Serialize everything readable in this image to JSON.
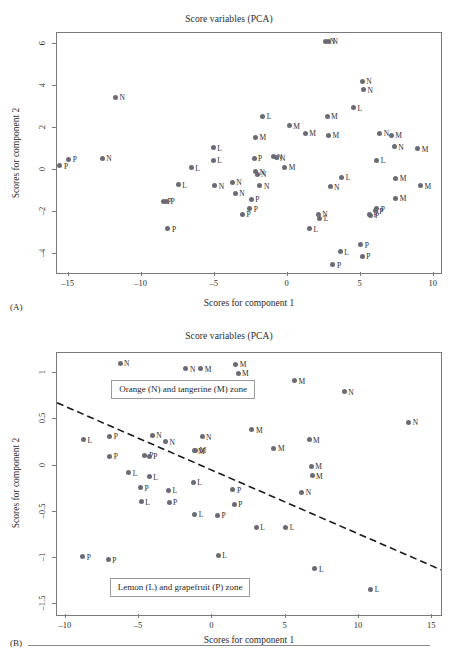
{
  "figure": {
    "panel_a_label": "(A)",
    "panel_b_label": "(B)"
  },
  "chart_data": [
    {
      "panel": "(A)",
      "type": "scatter",
      "title": "Score variables (PCA)",
      "xlabel": "Scores for component 1",
      "ylabel": "Scores for component 2",
      "xlim": [
        -15.8,
        10.5
      ],
      "ylim": [
        -4.9,
        6.5
      ],
      "xticks": [
        -15,
        -10,
        -5,
        0,
        5,
        10
      ],
      "xticklabels": [
        "–15",
        "–10",
        "–5",
        "0",
        "5",
        "10"
      ],
      "yticks": [
        -4,
        -2,
        0,
        2,
        4,
        6
      ],
      "yticklabels": [
        "–4",
        "–2",
        "0",
        "2",
        "4",
        "6"
      ],
      "grid": false,
      "legend": "none",
      "point_color": "#6b6b76",
      "groups": [
        "N",
        "M",
        "L",
        "P"
      ],
      "points": [
        {
          "x": -15.6,
          "y": 0.2,
          "label": "P"
        },
        {
          "x": -15.0,
          "y": 0.5,
          "label": "P"
        },
        {
          "x": -12.7,
          "y": 0.55,
          "label": "N"
        },
        {
          "x": -11.8,
          "y": 3.45,
          "label": "N"
        },
        {
          "x": -8.5,
          "y": -1.5,
          "label": "P"
        },
        {
          "x": -8.3,
          "y": -1.5,
          "label": "P"
        },
        {
          "x": -8.2,
          "y": -2.8,
          "label": "P"
        },
        {
          "x": -7.5,
          "y": -0.7,
          "label": "L"
        },
        {
          "x": -6.6,
          "y": 0.1,
          "label": "L"
        },
        {
          "x": -5.1,
          "y": 1.05,
          "label": "L"
        },
        {
          "x": -5.1,
          "y": 0.45,
          "label": "L"
        },
        {
          "x": -5.0,
          "y": -0.75,
          "label": "N"
        },
        {
          "x": -3.8,
          "y": -0.6,
          "label": "N"
        },
        {
          "x": -3.6,
          "y": -1.1,
          "label": "N"
        },
        {
          "x": -3.1,
          "y": -2.1,
          "label": "P"
        },
        {
          "x": -2.6,
          "y": -1.85,
          "label": "P"
        },
        {
          "x": -2.5,
          "y": -1.4,
          "label": "P"
        },
        {
          "x": -2.3,
          "y": 0.55,
          "label": "P"
        },
        {
          "x": -2.2,
          "y": 1.55,
          "label": "M"
        },
        {
          "x": -2.2,
          "y": -0.1,
          "label": "N"
        },
        {
          "x": -2.1,
          "y": -0.2,
          "label": "N"
        },
        {
          "x": -1.9,
          "y": -0.75,
          "label": "N"
        },
        {
          "x": -1.7,
          "y": 2.55,
          "label": "L"
        },
        {
          "x": -1.0,
          "y": 0.62,
          "label": "N"
        },
        {
          "x": -0.8,
          "y": 0.58,
          "label": "N"
        },
        {
          "x": -0.2,
          "y": 0.12,
          "label": "M"
        },
        {
          "x": 0.1,
          "y": 2.1,
          "label": "M"
        },
        {
          "x": 1.2,
          "y": 1.75,
          "label": "M"
        },
        {
          "x": 1.5,
          "y": -2.8,
          "label": "L"
        },
        {
          "x": 2.1,
          "y": -2.1,
          "label": "N"
        },
        {
          "x": 2.2,
          "y": -2.3,
          "label": "L"
        },
        {
          "x": 2.6,
          "y": 6.1,
          "label": "N"
        },
        {
          "x": 2.8,
          "y": 6.1,
          "label": "N"
        },
        {
          "x": 2.7,
          "y": 2.55,
          "label": "M"
        },
        {
          "x": 2.8,
          "y": 1.65,
          "label": "M"
        },
        {
          "x": 2.9,
          "y": -0.8,
          "label": "N"
        },
        {
          "x": 3.1,
          "y": -4.5,
          "label": "P"
        },
        {
          "x": 3.6,
          "y": -3.9,
          "label": "L"
        },
        {
          "x": 3.7,
          "y": -0.35,
          "label": "L"
        },
        {
          "x": 4.5,
          "y": 2.95,
          "label": "L"
        },
        {
          "x": 5.0,
          "y": -3.55,
          "label": "P"
        },
        {
          "x": 5.1,
          "y": 4.2,
          "label": "N"
        },
        {
          "x": 5.1,
          "y": -4.1,
          "label": "P"
        },
        {
          "x": 5.2,
          "y": 3.8,
          "label": "N"
        },
        {
          "x": 5.6,
          "y": -2.1,
          "label": "P"
        },
        {
          "x": 5.7,
          "y": -2.15,
          "label": "P"
        },
        {
          "x": 6.0,
          "y": -1.95,
          "label": "P"
        },
        {
          "x": 6.1,
          "y": -1.85,
          "label": "P"
        },
        {
          "x": 6.1,
          "y": 0.45,
          "label": "L"
        },
        {
          "x": 6.3,
          "y": 1.75,
          "label": "N"
        },
        {
          "x": 7.1,
          "y": 1.65,
          "label": "M"
        },
        {
          "x": 7.3,
          "y": 1.1,
          "label": "N"
        },
        {
          "x": 7.4,
          "y": -0.4,
          "label": "M"
        },
        {
          "x": 7.4,
          "y": -1.35,
          "label": "M"
        },
        {
          "x": 8.9,
          "y": 1.0,
          "label": "M"
        },
        {
          "x": 9.1,
          "y": -0.75,
          "label": "M"
        }
      ]
    },
    {
      "panel": "(B)",
      "type": "scatter",
      "title": "Score variables (PCA)",
      "xlabel": "Scores for component 1",
      "ylabel": "Scores for component 2",
      "xlim": [
        -10.6,
        15.6
      ],
      "ylim": [
        -1.62,
        1.22
      ],
      "xticks": [
        -10,
        -5,
        0,
        5,
        10,
        15
      ],
      "xticklabels": [
        "–10",
        "–5",
        "0",
        "5",
        "10",
        "15"
      ],
      "yticks": [
        -1.5,
        -1,
        -0.5,
        0,
        0.5,
        1
      ],
      "yticklabels": [
        "–1.5",
        "–1",
        "–0.5",
        "0",
        "0.5",
        "1"
      ],
      "grid": false,
      "legend": "none",
      "point_color": "#6b6b76",
      "groups": [
        "N",
        "M",
        "L",
        "P"
      ],
      "annotations": [
        {
          "text": "Orange (N) and tangerine (M) zone",
          "x": -6.9,
          "y": 0.84
        },
        {
          "text": "Lemon (L) and grapefruit (P) zone",
          "x": -7.0,
          "y": -1.31
        }
      ],
      "separator_line": {
        "style": "dashed",
        "x1": -10.6,
        "y1": 0.68,
        "x2": 15.6,
        "y2": -1.13
      },
      "points": [
        {
          "x": -8.8,
          "y": 0.28,
          "label": "L"
        },
        {
          "x": -8.85,
          "y": -0.99,
          "label": "P"
        },
        {
          "x": -7.1,
          "y": -1.02,
          "label": "P"
        },
        {
          "x": -7.0,
          "y": 0.32,
          "label": "P"
        },
        {
          "x": -7.0,
          "y": 0.1,
          "label": "P"
        },
        {
          "x": -6.3,
          "y": 1.11,
          "label": "N"
        },
        {
          "x": -5.7,
          "y": -0.08,
          "label": "L"
        },
        {
          "x": -4.9,
          "y": -0.24,
          "label": "P"
        },
        {
          "x": -4.85,
          "y": -0.39,
          "label": "L"
        },
        {
          "x": -4.6,
          "y": 0.11,
          "label": "P"
        },
        {
          "x": -4.3,
          "y": 0.1,
          "label": "P"
        },
        {
          "x": -4.3,
          "y": -0.12,
          "label": "L"
        },
        {
          "x": -4.1,
          "y": 0.33,
          "label": "N"
        },
        {
          "x": -3.2,
          "y": 0.26,
          "label": "N"
        },
        {
          "x": -3.0,
          "y": -0.27,
          "label": "L"
        },
        {
          "x": -2.95,
          "y": -0.4,
          "label": "P"
        },
        {
          "x": -1.8,
          "y": 1.05,
          "label": "N"
        },
        {
          "x": -1.3,
          "y": -0.18,
          "label": "L"
        },
        {
          "x": -1.25,
          "y": 0.16,
          "label": "M"
        },
        {
          "x": -1.15,
          "y": 0.165,
          "label": "M"
        },
        {
          "x": -1.2,
          "y": -0.53,
          "label": "L"
        },
        {
          "x": -0.8,
          "y": 1.05,
          "label": "M"
        },
        {
          "x": -0.7,
          "y": 0.31,
          "label": "N"
        },
        {
          "x": 0.35,
          "y": -0.54,
          "label": "P"
        },
        {
          "x": 0.4,
          "y": -0.97,
          "label": "L"
        },
        {
          "x": 1.6,
          "y": 1.1,
          "label": "M"
        },
        {
          "x": 1.75,
          "y": 1.0,
          "label": "M"
        },
        {
          "x": 1.4,
          "y": -0.26,
          "label": "P"
        },
        {
          "x": 1.5,
          "y": -0.42,
          "label": "P"
        },
        {
          "x": 2.7,
          "y": 0.39,
          "label": "M"
        },
        {
          "x": 3.0,
          "y": -0.67,
          "label": "L"
        },
        {
          "x": 4.2,
          "y": 0.19,
          "label": "M"
        },
        {
          "x": 5.0,
          "y": -0.67,
          "label": "L"
        },
        {
          "x": 5.6,
          "y": 0.92,
          "label": "M"
        },
        {
          "x": 6.1,
          "y": -0.29,
          "label": "N"
        },
        {
          "x": 6.6,
          "y": 0.28,
          "label": "M"
        },
        {
          "x": 6.75,
          "y": -0.01,
          "label": "M"
        },
        {
          "x": 6.8,
          "y": -0.11,
          "label": "M"
        },
        {
          "x": 7.0,
          "y": -1.12,
          "label": "L"
        },
        {
          "x": 9.0,
          "y": 0.8,
          "label": "N"
        },
        {
          "x": 10.8,
          "y": -1.34,
          "label": "L"
        },
        {
          "x": 13.4,
          "y": 0.47,
          "label": "N"
        }
      ]
    }
  ]
}
